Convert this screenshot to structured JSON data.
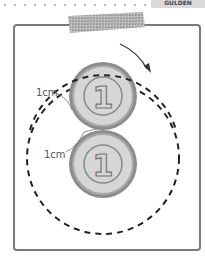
{
  "header": {
    "corner_label": "GULDEN"
  },
  "diagram": {
    "labels": {
      "top_distance": "1cm",
      "bottom_distance": "1cm"
    },
    "coin_numeral": "1",
    "colors": {
      "frame": "#7a7a7a",
      "coin_fill": "#d6d6d6",
      "coin_rim": "#8c8c8c",
      "tape": "#a9a9a9",
      "dashed_circle": "#222222",
      "arrow": "#333333"
    }
  }
}
